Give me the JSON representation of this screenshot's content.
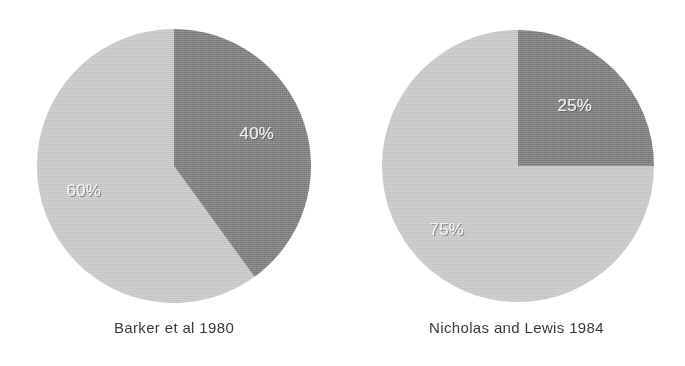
{
  "figure": {
    "background_color": "#ffffff",
    "dark_slice_color": "#808080",
    "light_slice_color": "#c8c8c8",
    "label_text_color": "#f4f4f4",
    "caption_text_color": "#353535"
  },
  "chart_data": [
    {
      "type": "pie",
      "title": "Barker et al 1980",
      "labels": [
        "40%",
        "60%"
      ],
      "values": [
        40,
        60
      ],
      "value_labels": [
        "40%",
        "60%"
      ],
      "colors": [
        "#808080",
        "#c8c8c8"
      ],
      "start_angle_deg": 0,
      "direction": "clockwise",
      "legend": "none",
      "grid": false
    },
    {
      "type": "pie",
      "title": "Nicholas and Lewis 1984",
      "labels": [
        "25%",
        "75%"
      ],
      "values": [
        25,
        75
      ],
      "value_labels": [
        "25%",
        "75%"
      ],
      "colors": [
        "#808080",
        "#c8c8c8"
      ],
      "start_angle_deg": 0,
      "direction": "clockwise",
      "legend": "none",
      "grid": false
    }
  ],
  "charts": {
    "left": {
      "caption": "Barker et al 1980",
      "dark_label": "40%",
      "light_label": "60%"
    },
    "right": {
      "caption": "Nicholas and Lewis 1984",
      "dark_label": "25%",
      "light_label": "75%"
    }
  }
}
